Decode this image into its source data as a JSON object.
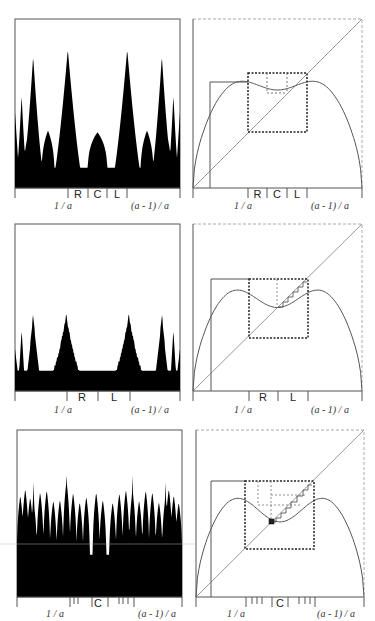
{
  "figure": {
    "rows": [
      {
        "id": "row1",
        "left_panel": {
          "type": "symbolic-density-plot",
          "fill": "#000000",
          "region_labels": [
            "R",
            "C",
            "L"
          ],
          "axis_labels": {
            "left": "1 / a",
            "right": "(a - 1) / a"
          }
        },
        "right_panel": {
          "type": "cobweb-map-plot",
          "region_labels": [
            "R",
            "C",
            "L"
          ],
          "axis_labels": {
            "left": "1 / a",
            "right": "(a - 1) / a"
          }
        }
      },
      {
        "id": "row2",
        "left_panel": {
          "type": "symbolic-density-plot",
          "fill": "#000000",
          "region_labels": [
            "R",
            "L"
          ],
          "axis_labels": {
            "left": "1 / a",
            "right": "(a - 1) / a"
          }
        },
        "right_panel": {
          "type": "cobweb-map-plot",
          "region_labels": [
            "R",
            "L"
          ],
          "axis_labels": {
            "left": "1 / a",
            "right": "(a - 1) / a"
          }
        }
      },
      {
        "id": "row3",
        "left_panel": {
          "type": "symbolic-density-plot",
          "fill": "#000000",
          "region_labels": [
            "C"
          ],
          "axis_labels": {
            "left": "1 / a",
            "right": "(a - 1) / a"
          }
        },
        "right_panel": {
          "type": "cobweb-map-plot",
          "region_labels": [
            "C"
          ],
          "axis_labels": {
            "left": "1 / a",
            "right": "(a - 1) / a"
          }
        }
      }
    ],
    "colors": {
      "curve": "#555555",
      "frame": "#666666",
      "dashed_frame": "#999999",
      "fill": "#000000"
    }
  }
}
